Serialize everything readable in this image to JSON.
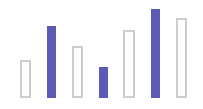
{
  "chart_data": {
    "type": "bar",
    "title": "",
    "xlabel": "",
    "ylabel": "",
    "grid": false,
    "legend": null,
    "categories": [
      "1",
      "2",
      "3",
      "4",
      "5",
      "6",
      "7"
    ],
    "values": [
      38,
      72,
      52,
      31,
      68,
      89,
      80
    ],
    "styles": [
      "outline",
      "filled",
      "outline",
      "filled",
      "outline",
      "filled",
      "outline"
    ],
    "ylim": [
      0,
      98
    ],
    "colors": {
      "filled": "#5b5bb5",
      "outline_border": "#cdcdcd",
      "outline_fill": "#ffffff"
    }
  },
  "layout": {
    "baseline_y": 98,
    "bars": [
      {
        "x": 20,
        "width": 11
      },
      {
        "x": 47,
        "width": 9
      },
      {
        "x": 72,
        "width": 11
      },
      {
        "x": 99,
        "width": 9
      },
      {
        "x": 123,
        "width": 12
      },
      {
        "x": 151,
        "width": 9
      },
      {
        "x": 176,
        "width": 11
      }
    ]
  }
}
